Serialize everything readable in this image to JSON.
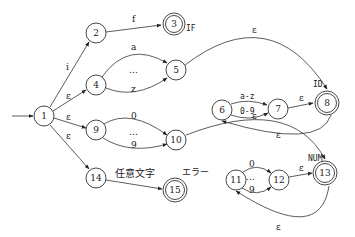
{
  "diagram": {
    "type": "NFA state transition diagram (lexical analyzer)",
    "start_state": "1",
    "states": [
      {
        "id": "1",
        "x": 44,
        "y": 116,
        "accepting": false
      },
      {
        "id": "2",
        "x": 96,
        "y": 33,
        "accepting": false
      },
      {
        "id": "3",
        "x": 174,
        "y": 24,
        "accepting": true,
        "token": "IF"
      },
      {
        "id": "4",
        "x": 96,
        "y": 85,
        "accepting": false
      },
      {
        "id": "5",
        "x": 176,
        "y": 70,
        "accepting": false
      },
      {
        "id": "6",
        "x": 222,
        "y": 110,
        "accepting": false
      },
      {
        "id": "7",
        "x": 278,
        "y": 109,
        "accepting": false
      },
      {
        "id": "8",
        "x": 327,
        "y": 103,
        "accepting": true,
        "token": "ID"
      },
      {
        "id": "9",
        "x": 96,
        "y": 130,
        "accepting": false
      },
      {
        "id": "10",
        "x": 176,
        "y": 140,
        "accepting": false
      },
      {
        "id": "11",
        "x": 236,
        "y": 180,
        "accepting": false
      },
      {
        "id": "12",
        "x": 279,
        "y": 180,
        "accepting": false
      },
      {
        "id": "13",
        "x": 325,
        "y": 173,
        "accepting": true,
        "token": "NUM"
      },
      {
        "id": "14",
        "x": 96,
        "y": 178,
        "accepting": false
      },
      {
        "id": "15",
        "x": 175,
        "y": 190,
        "accepting": true,
        "token": "エラー"
      }
    ],
    "edges": [
      {
        "from": "1",
        "to": "2",
        "label": "i"
      },
      {
        "from": "2",
        "to": "3",
        "label": "f"
      },
      {
        "from": "1",
        "to": "4",
        "label": "ε"
      },
      {
        "from": "4",
        "to": "5",
        "label": "a"
      },
      {
        "from": "4",
        "to": "5",
        "label": "z"
      },
      {
        "from": "4",
        "to": "5",
        "label": "…"
      },
      {
        "from": "5",
        "to": "8",
        "label": "ε"
      },
      {
        "from": "6",
        "to": "7",
        "label": "a-z"
      },
      {
        "from": "6",
        "to": "7",
        "label": "0-9"
      },
      {
        "from": "7",
        "to": "8",
        "label": "ε"
      },
      {
        "from": "8",
        "to": "6",
        "label": "ε"
      },
      {
        "from": "1",
        "to": "9",
        "label": "ε"
      },
      {
        "from": "9",
        "to": "10",
        "label": "0"
      },
      {
        "from": "9",
        "to": "10",
        "label": "9"
      },
      {
        "from": "9",
        "to": "10",
        "label": "…"
      },
      {
        "from": "10",
        "to": "13",
        "label": "ε"
      },
      {
        "from": "11",
        "to": "12",
        "label": "0"
      },
      {
        "from": "11",
        "to": "12",
        "label": "9"
      },
      {
        "from": "11",
        "to": "12",
        "label": "…"
      },
      {
        "from": "12",
        "to": "13",
        "label": "ε"
      },
      {
        "from": "13",
        "to": "11",
        "label": "ε"
      },
      {
        "from": "1",
        "to": "14",
        "label": "ε"
      },
      {
        "from": "14",
        "to": "15",
        "label": "任意文字"
      }
    ]
  },
  "labels": {
    "n1": "1",
    "n2": "2",
    "n3": "3",
    "n4": "4",
    "n5": "5",
    "n6": "6",
    "n7": "7",
    "n8": "8",
    "n9": "9",
    "n10": "10",
    "n11": "11",
    "n12": "12",
    "n13": "13",
    "n14": "14",
    "n15": "15",
    "tok_if": "IF",
    "tok_id": "ID",
    "tok_num": "NUM",
    "tok_err": "エラー",
    "e_1_2": "i",
    "e_2_3": "f",
    "e_1_4": "ε",
    "e_4_5_a": "a",
    "e_4_5_dots": "…",
    "e_4_5_z": "z",
    "e_5_8": "ε",
    "e_6_7_az": "a-z",
    "e_6_7_09": "0-9",
    "e_7_8": "ε",
    "e_8_6": "ε",
    "e_1_9": "ε",
    "e_9_10_0": "0",
    "e_9_10_dots": "…",
    "e_9_10_9": "9",
    "e_10_13": "ε",
    "e_11_12_0": "0",
    "e_11_12_dots": "…",
    "e_11_12_9": "9",
    "e_12_13": "ε",
    "e_13_11": "ε",
    "e_1_14": "ε",
    "e_14_15": "任意文字"
  }
}
